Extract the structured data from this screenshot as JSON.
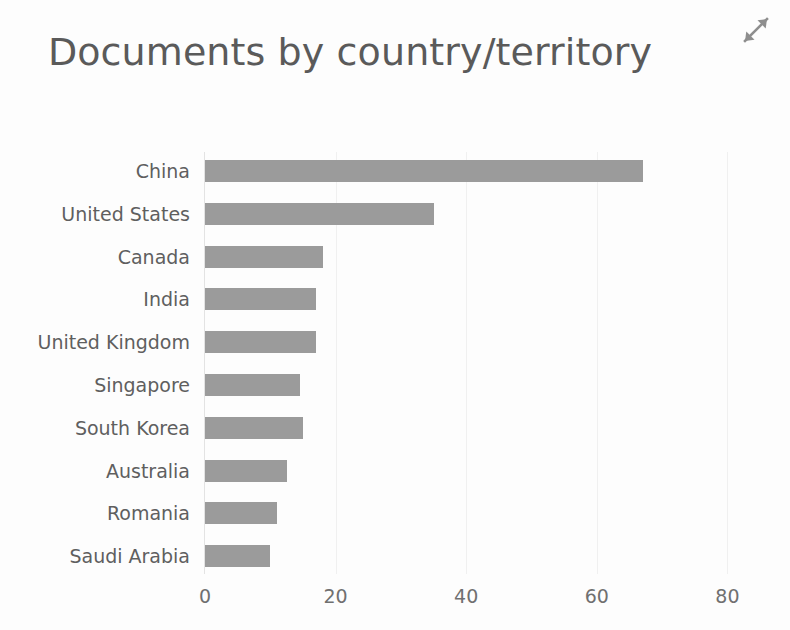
{
  "header": {
    "title": "Documents by country/territory",
    "expand_icon": "expand-diagonal-arrows-icon"
  },
  "colors": {
    "bar_fill": "#9b9b9b",
    "title_text": "#5a5a5a",
    "label_text": "#5f5f5f",
    "tick_text": "#707070",
    "axis_line": "#e3e3e3",
    "gridline": "#f0f0f0",
    "background": "#fdfdfd"
  },
  "chart_data": {
    "type": "bar",
    "orientation": "horizontal",
    "title": "Documents by country/territory",
    "xlabel": "",
    "ylabel": "",
    "xlim": [
      0,
      80
    ],
    "xticks": [
      0,
      20,
      40,
      60,
      80
    ],
    "xtick_labels": [
      "0",
      "20",
      "40",
      "60",
      "80"
    ],
    "grid": true,
    "legend": false,
    "categories": [
      "China",
      "United States",
      "Canada",
      "India",
      "United Kingdom",
      "Singapore",
      "South Korea",
      "Australia",
      "Romania",
      "Saudi Arabia"
    ],
    "values": [
      67,
      35,
      18,
      17,
      17,
      14.5,
      15,
      12.5,
      11,
      10
    ],
    "series": [
      {
        "name": "Documents",
        "values": [
          67,
          35,
          18,
          17,
          17,
          14.5,
          15,
          12.5,
          11,
          10
        ]
      }
    ]
  }
}
